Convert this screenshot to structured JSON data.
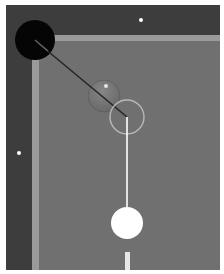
{
  "diagram": {
    "colors": {
      "frame": "#ffffff",
      "rail": "#3d3d3d",
      "cushion": "#9a9a9a",
      "felt": "#707070",
      "pocket": "#050505",
      "diamond": "#ffffff",
      "cue_ball": "#ffffff",
      "object_ball_fill": "#7c7c7c",
      "object_ball_edge": "#5e5e5e",
      "ghost_ball_outline": "#b8b8b8",
      "aim_line": "#ffffff",
      "shot_line": "#262626",
      "cue_tip": "#e8e8e8"
    },
    "table": {
      "bounds": {
        "x": 6,
        "y": 5,
        "width": 214,
        "height": 265
      },
      "rail_top_height": 30,
      "rail_left_width": 26,
      "cushion_width": 6
    },
    "pocket": {
      "cx": 35,
      "cy": 40,
      "r": 20
    },
    "diamonds": [
      {
        "cx": 141,
        "cy": 20,
        "r": 2
      },
      {
        "cx": 19,
        "cy": 153,
        "r": 2
      }
    ],
    "object_ball": {
      "cx": 104,
      "cy": 96,
      "r": 16,
      "highlight": {
        "cx": 106,
        "cy": 86,
        "r": 2
      }
    },
    "ghost_ball": {
      "cx": 127,
      "cy": 117,
      "r": 17
    },
    "cue_ball": {
      "cx": 127,
      "cy": 223,
      "r": 16
    },
    "shot_line": {
      "x1": 35,
      "y1": 40,
      "x2": 127,
      "y2": 117
    },
    "aim_line": {
      "x1": 127,
      "y1": 117,
      "x2": 127,
      "y2": 207
    },
    "cue_tip": {
      "x": 125,
      "y": 252,
      "width": 5,
      "height": 18
    }
  }
}
